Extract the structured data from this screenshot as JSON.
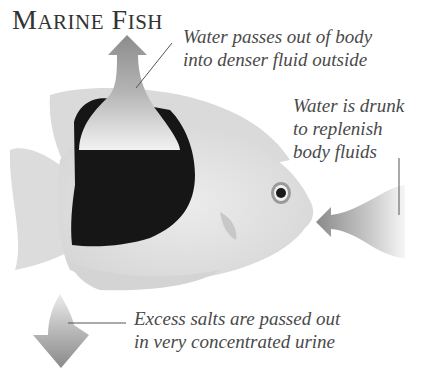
{
  "title": {
    "first_cap": "M",
    "first_rest": "ARINE",
    "second_cap": "F",
    "second_rest": "ISH"
  },
  "labels": {
    "water_out": [
      "Water passes out of body",
      "into denser fluid outside"
    ],
    "water_drunk": [
      "Water is drunk",
      "to replenish",
      "body fluids"
    ],
    "salts_out": [
      "Excess salts are passed out",
      "in very concentrated urine"
    ]
  },
  "icons": {
    "up_arrow": "arrow-up-water-out",
    "left_arrow": "arrow-left-water-in",
    "down_arrow": "arrow-down-salts-out",
    "fish": "marine-angelfish-illustration"
  },
  "colors": {
    "text": "#4a4a4a",
    "arrow": "#8a8a8a",
    "fish_body": "#e4e4e4",
    "fish_band": "#141414"
  }
}
